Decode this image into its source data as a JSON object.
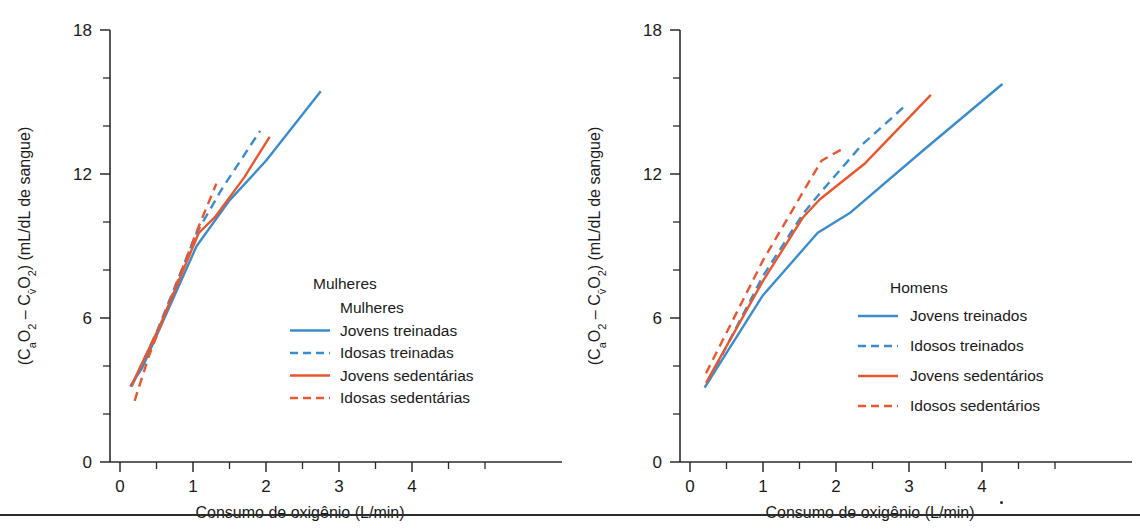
{
  "colors": {
    "blue": "#3a8ccc",
    "red": "#e8572e",
    "axis": "#2b2b2b",
    "background": "#ffffff"
  },
  "axes": {
    "x_title": "Consumo de oxigênio (L/min)",
    "y_title": "(CaO2 – Cv̄O2) (mL/dL de sangue)",
    "x_ticks": [
      "0",
      "1",
      "2",
      "3",
      "4"
    ],
    "y_ticks": [
      "0",
      "6",
      "12",
      "18"
    ],
    "xlim": [
      0,
      4.3
    ],
    "ylim": [
      0,
      18
    ],
    "x_major_step": 1,
    "x_minor_step": 0.5,
    "y_major_step": 6,
    "y_minor_step": 2,
    "grid": false
  },
  "panels": [
    {
      "id": "mulheres",
      "legend_title": "Mulheres",
      "legend_position": "center-right",
      "legend_entries": [
        {
          "label": "Mulheres",
          "style": "none",
          "color": "none"
        },
        {
          "label": "Jovens treinadas",
          "style": "solid",
          "color": "#3a8ccc"
        },
        {
          "label": "Idosas treinadas",
          "style": "dashed",
          "color": "#3a8ccc"
        },
        {
          "label": "Jovens sedentárias",
          "style": "solid",
          "color": "#e8572e"
        },
        {
          "label": "Idosas sedentárias",
          "style": "dashed",
          "color": "#e8572e"
        }
      ]
    },
    {
      "id": "homens",
      "legend_title": "Homens",
      "legend_position": "center-right",
      "legend_entries": [
        {
          "label": "Jovens treinados",
          "style": "solid",
          "color": "#3a8ccc"
        },
        {
          "label": "Idosos treinados",
          "style": "dashed",
          "color": "#3a8ccc"
        },
        {
          "label": "Jovens sedentários",
          "style": "solid",
          "color": "#e8572e"
        },
        {
          "label": "Idosos sedentários",
          "style": "dashed",
          "color": "#e8572e"
        }
      ]
    }
  ],
  "chart_data": [
    {
      "type": "line",
      "title": "Mulheres",
      "xlabel": "Consumo de oxigênio (L/min)",
      "ylabel": "(CaO2 – Cv̄O2) (mL/dL de sangue)",
      "xlim": [
        0,
        4.3
      ],
      "ylim": [
        0,
        18
      ],
      "xticks": [
        0,
        1,
        2,
        3,
        4
      ],
      "yticks": [
        0,
        6,
        12,
        18
      ],
      "grid": false,
      "legend_position": "center-right",
      "series": [
        {
          "name": "Jovens treinadas",
          "style": "solid",
          "color": "#3a8ccc",
          "x": [
            0.14,
            0.3,
            1.05,
            1.5,
            2.0,
            2.75
          ],
          "y": [
            3.15,
            3.9,
            9.0,
            10.9,
            12.55,
            15.45
          ]
        },
        {
          "name": "Idosas treinadas",
          "style": "dashed",
          "color": "#3a8ccc",
          "x": [
            0.16,
            0.5,
            1.05,
            1.4,
            1.92
          ],
          "y": [
            3.15,
            5.4,
            9.55,
            11.4,
            13.8
          ]
        },
        {
          "name": "Jovens sedentárias",
          "style": "solid",
          "color": "#e8572e",
          "x": [
            0.15,
            0.55,
            1.08,
            1.3,
            1.7,
            2.05
          ],
          "y": [
            3.15,
            5.7,
            9.55,
            10.2,
            11.85,
            13.55
          ]
        },
        {
          "name": "Idosas sedentárias",
          "style": "dashed",
          "color": "#e8572e",
          "x": [
            0.2,
            0.4,
            1.05,
            1.32
          ],
          "y": [
            2.55,
            4.45,
            9.6,
            11.6
          ]
        }
      ]
    },
    {
      "type": "line",
      "title": "Homens",
      "xlabel": "Consumo de oxigênio (L/min)",
      "ylabel": "(CaO2 – Cv̄O2) (mL/dL de sangue)",
      "xlim": [
        0,
        4.3
      ],
      "ylim": [
        0,
        18
      ],
      "xticks": [
        0,
        1,
        2,
        3,
        4
      ],
      "yticks": [
        0,
        6,
        12,
        18
      ],
      "grid": false,
      "legend_position": "center-right",
      "series": [
        {
          "name": "Jovens treinados",
          "style": "solid",
          "color": "#3a8ccc",
          "x": [
            0.2,
            1.0,
            1.75,
            2.2,
            3.2,
            4.28
          ],
          "y": [
            3.1,
            6.95,
            9.55,
            10.4,
            13.0,
            15.75
          ]
        },
        {
          "name": "Idosos treinados",
          "style": "dashed",
          "color": "#3a8ccc",
          "x": [
            0.25,
            1.0,
            1.55,
            1.78,
            2.35,
            2.95
          ],
          "y": [
            3.35,
            7.75,
            10.35,
            11.2,
            13.2,
            14.85
          ]
        },
        {
          "name": "Jovens sedentários",
          "style": "solid",
          "color": "#e8572e",
          "x": [
            0.22,
            1.0,
            1.55,
            1.78,
            2.4,
            3.3
          ],
          "y": [
            3.3,
            7.55,
            10.2,
            10.95,
            12.45,
            15.3
          ]
        },
        {
          "name": "Idosos sedentários",
          "style": "dashed",
          "color": "#e8572e",
          "x": [
            0.22,
            1.0,
            1.5,
            1.8,
            2.12
          ],
          "y": [
            3.7,
            8.4,
            11.0,
            12.55,
            13.1
          ]
        }
      ]
    }
  ]
}
